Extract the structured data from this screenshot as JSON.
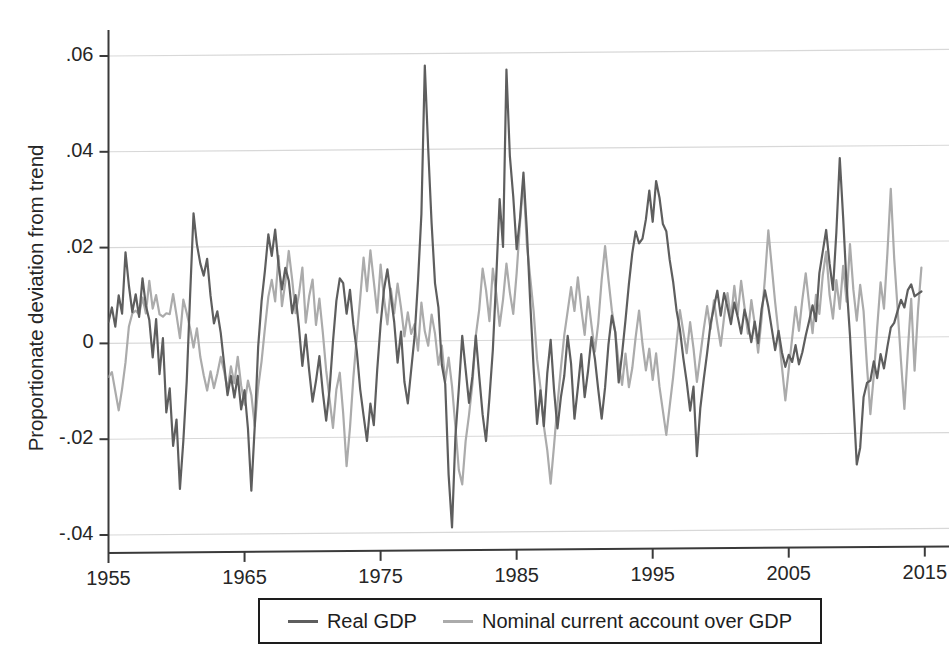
{
  "chart_data": {
    "type": "line",
    "title": "",
    "xlabel": "",
    "ylabel": "Proportionate deviation from trend",
    "xlim": [
      1955,
      2015.75
    ],
    "ylim": [
      -0.04,
      0.06
    ],
    "grid": true,
    "grid_axis": "y",
    "legend_position": "bottom-outside",
    "x_ticks": [
      "1955",
      "1965",
      "1975",
      "1985",
      "1995",
      "2005",
      "2015"
    ],
    "x_tick_values": [
      1955,
      1965,
      1975,
      1985,
      1995,
      2005,
      2015
    ],
    "y_ticks": [
      ".06",
      ".04",
      ".02",
      "0",
      "-.02",
      "-.04"
    ],
    "y_tick_values": [
      0.06,
      0.04,
      0.02,
      0,
      -0.02,
      -0.04
    ],
    "x_start": 1955,
    "x_step": 0.25,
    "series": [
      {
        "name": "Real GDP",
        "color": "#5e5e5e",
        "width": 2.2,
        "values": [
          0.0045,
          0.0075,
          0.0035,
          0.01,
          0.0062,
          0.019,
          0.012,
          0.0065,
          0.0102,
          0.0055,
          0.0135,
          0.0078,
          0.0048,
          -0.003,
          0.005,
          -0.0065,
          0.001,
          -0.0145,
          -0.0095,
          -0.0215,
          -0.016,
          -0.0305,
          -0.0205,
          -0.008,
          0.01,
          0.027,
          0.0205,
          0.0165,
          0.014,
          0.0175,
          0.0098,
          0.004,
          0.0065,
          0.002,
          -0.0045,
          -0.011,
          -0.007,
          -0.0115,
          -0.007,
          -0.014,
          -0.01,
          -0.018,
          -0.031,
          -0.0175,
          -0.001,
          0.0085,
          0.015,
          0.0225,
          0.018,
          0.0235,
          0.016,
          0.011,
          0.0155,
          0.0128,
          0.006,
          0.0098,
          0.003,
          -0.005,
          0.0015,
          -0.006,
          -0.0125,
          -0.0082,
          -0.003,
          -0.0105,
          -0.0165,
          -0.01,
          0.0,
          0.0085,
          0.0132,
          0.0122,
          0.0058,
          0.0108,
          0.0035,
          -0.002,
          -0.01,
          -0.0155,
          -0.0208,
          -0.013,
          -0.0175,
          -0.006,
          0.0035,
          0.0108,
          0.015,
          0.0095,
          0.004,
          -0.0045,
          0.002,
          -0.0085,
          -0.013,
          -0.006,
          0.001,
          0.0125,
          0.0265,
          0.0575,
          0.04,
          0.0245,
          0.012,
          0.007,
          -0.005,
          -0.009,
          -0.028,
          -0.039,
          -0.02,
          -0.01,
          0.001,
          -0.006,
          -0.013,
          -0.0075,
          0.001,
          -0.0075,
          -0.0155,
          -0.021,
          -0.012,
          -0.002,
          0.013,
          0.0295,
          0.0195,
          0.0565,
          0.0385,
          0.03,
          0.019,
          0.0255,
          0.035,
          0.023,
          0.0078,
          -0.006,
          -0.0175,
          -0.0105,
          -0.018,
          -0.007,
          0.0,
          -0.0105,
          -0.0185,
          -0.012,
          -0.0075,
          0.0008,
          -0.005,
          -0.0165,
          -0.01,
          -0.003,
          -0.012,
          -0.0065,
          0.0005,
          -0.004,
          -0.0105,
          -0.0165,
          -0.01,
          -0.001,
          0.005,
          0.0015,
          -0.009,
          -0.003,
          0.004,
          0.0115,
          0.018,
          0.0225,
          0.02,
          0.021,
          0.025,
          0.031,
          0.0245,
          0.033,
          0.0295,
          0.024,
          0.0225,
          0.0165,
          0.012,
          0.006,
          0.002,
          -0.004,
          -0.009,
          -0.015,
          -0.01,
          -0.0245,
          -0.0145,
          -0.0085,
          -0.003,
          0.003,
          0.0065,
          0.01,
          0.0048,
          0.0095,
          0.0065,
          0.003,
          0.0075,
          0.0045,
          0.001,
          0.006,
          0.003,
          -0.0008,
          0.0035,
          -0.001,
          0.006,
          0.01,
          0.0065,
          0.002,
          -0.0025,
          0.0015,
          -0.003,
          -0.006,
          -0.0035,
          -0.005,
          -0.0015,
          -0.0055,
          -0.003,
          0.0005,
          0.0035,
          0.0068,
          0.0035,
          0.0135,
          0.018,
          0.0225,
          0.0155,
          0.01,
          0.022,
          0.0375,
          0.025,
          0.011,
          0.0005,
          -0.013,
          -0.0265,
          -0.023,
          -0.0125,
          -0.0095,
          -0.009,
          -0.005,
          -0.0085,
          -0.0035,
          -0.0065,
          -0.002,
          0.002,
          0.003,
          0.0055,
          0.0078,
          0.0062,
          0.0098,
          0.011,
          0.0085,
          0.009,
          0.0095
        ]
      },
      {
        "name": "Nominal current account over GDP",
        "color": "#ababab",
        "width": 2.2,
        "values": [
          -0.007,
          -0.006,
          -0.01,
          -0.014,
          -0.0095,
          -0.004,
          0.0035,
          0.0062,
          0.0068,
          0.006,
          0.0095,
          0.0062,
          0.013,
          0.0072,
          0.01,
          0.006,
          0.0055,
          0.0062,
          0.006,
          0.0102,
          0.0058,
          0.001,
          0.009,
          0.0062,
          0.003,
          -0.001,
          0.003,
          -0.003,
          -0.0068,
          -0.01,
          -0.006,
          -0.0095,
          -0.0065,
          -0.003,
          -0.006,
          -0.01,
          -0.005,
          -0.0085,
          -0.003,
          -0.009,
          -0.013,
          -0.008,
          -0.011,
          -0.0175,
          -0.0095,
          -0.004,
          0.003,
          0.0095,
          0.013,
          0.0085,
          0.018,
          0.0075,
          0.0125,
          0.019,
          0.013,
          0.006,
          0.01,
          0.0155,
          0.004,
          0.0095,
          0.013,
          0.0035,
          0.009,
          0.002,
          -0.006,
          -0.012,
          -0.018,
          -0.01,
          -0.0065,
          -0.015,
          -0.026,
          -0.018,
          -0.0075,
          0.001,
          0.009,
          0.0175,
          0.0105,
          0.019,
          0.0125,
          0.006,
          0.016,
          0.009,
          0.0035,
          0.011,
          0.0058,
          0.012,
          0.007,
          0.001,
          0.006,
          0.0015,
          0.0035,
          -0.002,
          0.008,
          0.002,
          -0.001,
          0.0055,
          0.0015,
          -0.005,
          -0.001,
          -0.0085,
          -0.0035,
          -0.0095,
          -0.018,
          -0.027,
          -0.03,
          -0.021,
          -0.0155,
          -0.009,
          0.001,
          0.0065,
          0.015,
          0.0105,
          0.004,
          0.015,
          0.0098,
          0.003,
          0.0085,
          0.016,
          0.01,
          0.0055,
          0.014,
          0.0245,
          0.0335,
          0.02,
          0.013,
          0.006,
          -0.004,
          -0.01,
          -0.018,
          -0.023,
          -0.03,
          -0.022,
          -0.0135,
          -0.006,
          0.001,
          0.006,
          0.011,
          0.006,
          0.013,
          0.0065,
          0.001,
          0.009,
          0.003,
          -0.0025,
          0.0035,
          0.0125,
          0.0195,
          0.0125,
          0.006,
          0.0015,
          -0.005,
          -0.0095,
          -0.003,
          -0.01,
          -0.006,
          0.0005,
          0.006,
          -0.001,
          -0.0065,
          -0.002,
          -0.0085,
          -0.003,
          -0.01,
          -0.015,
          -0.02,
          -0.014,
          -0.008,
          -0.001,
          0.006,
          0.0015,
          -0.003,
          0.0035,
          -0.002,
          -0.009,
          -0.0035,
          0.002,
          0.0068,
          0.002,
          0.008,
          0.003,
          -0.0015,
          0.0045,
          0.0095,
          0.004,
          0.011,
          0.005,
          0.012,
          0.0065,
          0.001,
          0.008,
          0.003,
          -0.003,
          0.004,
          0.0125,
          0.0225,
          0.015,
          0.0075,
          0.001,
          -0.006,
          -0.013,
          -0.0065,
          0.0,
          0.0065,
          0.0015,
          0.008,
          0.0135,
          0.007,
          0.001,
          0.009,
          0.005,
          0.013,
          0.018,
          0.009,
          0.004,
          0.012,
          0.006,
          0.015,
          0.0075,
          0.0195,
          0.01,
          0.0035,
          0.011,
          0.0055,
          -0.006,
          -0.016,
          -0.008,
          0.002,
          0.0115,
          0.006,
          0.0175,
          0.031,
          0.0165,
          0.006,
          -0.005,
          -0.015,
          -0.003,
          0.008,
          -0.007,
          0.0055,
          0.0145
        ]
      }
    ]
  },
  "legend": {
    "entries": [
      {
        "label": "Real GDP",
        "color": "#5e5e5e"
      },
      {
        "label": "Nominal current account over GDP",
        "color": "#ababab"
      }
    ]
  },
  "axis": {
    "y_label": "Proportionate deviation from trend",
    "y_tick_labels": [
      ".06",
      ".04",
      ".02",
      "0",
      "-.02",
      "-.04"
    ],
    "x_tick_labels": [
      "1955",
      "1965",
      "1975",
      "1985",
      "1995",
      "2005",
      "2015"
    ]
  },
  "colors": {
    "background": "#ffffff",
    "axis": "#3a3a3a",
    "grid": "#d8d8d8",
    "text": "#262626",
    "series_primary": "#5e5e5e",
    "series_secondary": "#ababab"
  }
}
